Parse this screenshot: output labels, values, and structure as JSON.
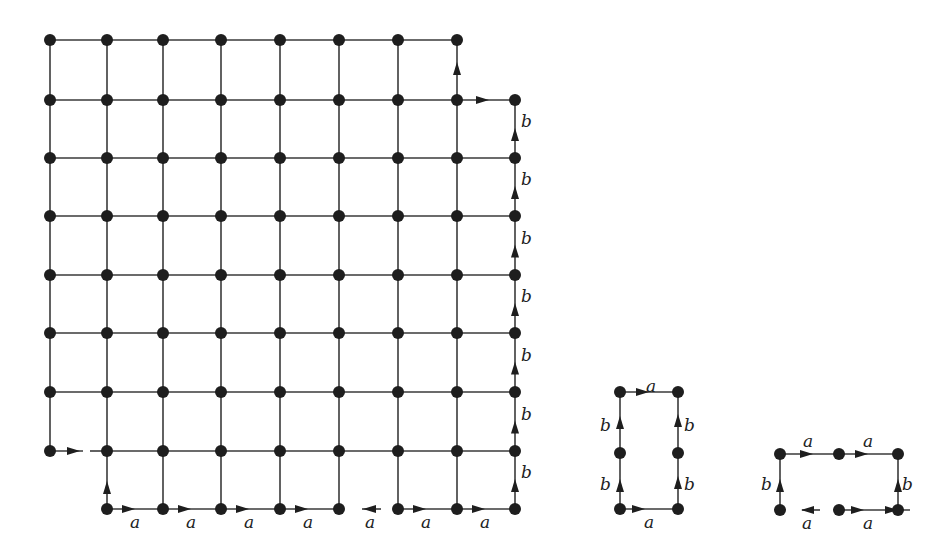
{
  "colors": {
    "edge": "#3a3a3a",
    "node": "#1e1e1e",
    "background": "#ffffff"
  },
  "main_grid": {
    "cols_x": [
      50,
      107,
      163,
      221,
      280,
      339,
      398,
      457,
      515
    ],
    "rows_y": [
      40,
      100,
      158,
      216,
      275,
      333,
      392,
      451,
      509
    ],
    "description": "8x8 grid of nodes (cols 0-7, rows 0-7) plus extra column 8 (rows 1-8) and extra bottom row 8 (cols 1-8); bottom-left node (col 0,row 7) connects by a directed edge to col 1 row 7 only",
    "arrows": [
      {
        "from": [
          0,
          7
        ],
        "to": [
          1,
          7
        ]
      },
      {
        "from": [
          1,
          8
        ],
        "to": [
          1,
          7
        ]
      },
      {
        "from": [
          7,
          1
        ],
        "to": [
          7,
          0
        ]
      },
      {
        "from": [
          7,
          1
        ],
        "to": [
          8,
          1
        ]
      }
    ],
    "bottom_row_labels": [
      "a",
      "a",
      "a",
      "a",
      "a",
      "a",
      "a"
    ],
    "right_column_labels": [
      "b",
      "b",
      "b",
      "b",
      "b",
      "b",
      "b"
    ]
  },
  "figure_rect": {
    "nodes": [
      [
        620,
        396
      ],
      [
        678,
        396
      ],
      [
        620,
        455
      ],
      [
        678,
        455
      ],
      [
        620,
        509
      ],
      [
        678,
        509
      ]
    ],
    "labels": {
      "top": "a",
      "bottom": "a",
      "left_upper": "b",
      "left_lower": "b",
      "right_upper": "b",
      "right_lower": "b"
    }
  },
  "figure_open": {
    "nodes": [
      [
        780,
        455
      ],
      [
        839,
        455
      ],
      [
        898,
        455
      ],
      [
        780,
        509
      ],
      [
        839,
        509
      ],
      [
        898,
        509
      ]
    ],
    "labels": {
      "top_left": "a",
      "top_right": "a",
      "left": "b",
      "right": "b",
      "bottom_left": "a",
      "bottom_right": "a"
    }
  }
}
